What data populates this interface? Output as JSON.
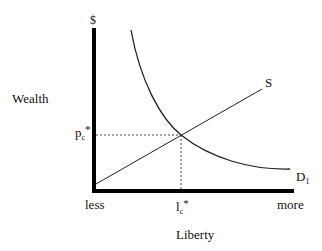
{
  "diagram": {
    "y_axis_label": "Wealth",
    "y_axis_unit": "$",
    "x_axis_label": "Liberty",
    "x_min_label": "less",
    "x_max_label": "more",
    "supply_label": "S",
    "demand_label": "D",
    "demand_subscript": "1",
    "price_eq_label": "p",
    "price_eq_subscript": "c",
    "price_eq_star": "*",
    "liberty_eq_label": "l",
    "liberty_eq_subscript": "c",
    "liberty_eq_star": "*",
    "colors": {
      "axis": "#000000",
      "curve": "#222222",
      "dashed": "#333333"
    }
  }
}
